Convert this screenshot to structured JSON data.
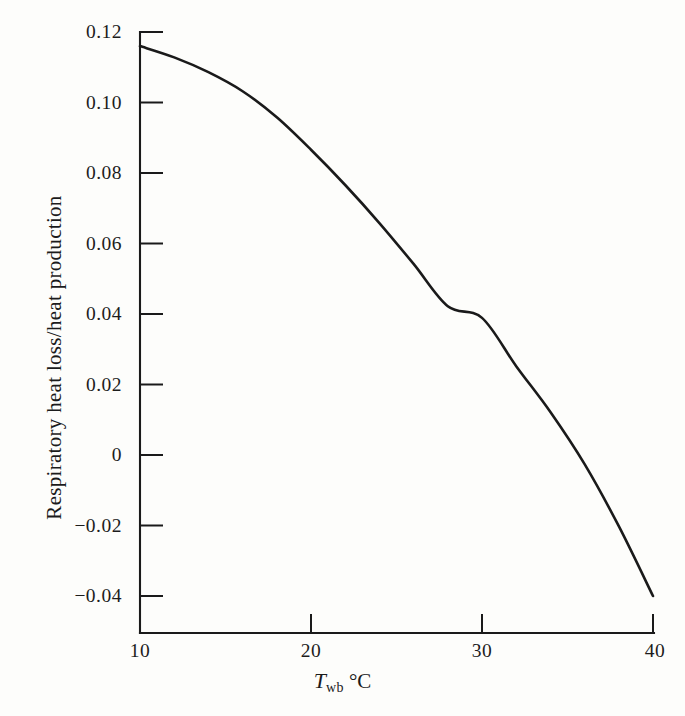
{
  "chart_data": {
    "type": "line",
    "title": "",
    "subtitle": "",
    "xlabel_symbol": "T",
    "xlabel_subscript": "wb",
    "xlabel_unit": "°C",
    "xlabel": "T_wb °C",
    "ylabel": "Respiratory heat loss/heat production",
    "xlim": [
      10,
      40
    ],
    "ylim": [
      -0.04,
      0.12
    ],
    "xticks": [
      10,
      20,
      30,
      40
    ],
    "yticks": [
      0.12,
      0.1,
      0.08,
      0.06,
      0.04,
      0.02,
      0,
      -0.02,
      -0.04
    ],
    "xtick_labels": [
      "10",
      "20",
      "30",
      "40"
    ],
    "ytick_labels": [
      "0.12",
      "0.10",
      "0.08",
      "0.06",
      "0.04",
      "0.02",
      "0",
      "−0.02",
      "−0.04"
    ],
    "grid": false,
    "legend": null,
    "legend_position": "none",
    "line_color": "#1a1a1a",
    "line_width": 2.6,
    "background_color": "#fdfdfb",
    "axis_color": "#1a1a1a",
    "series": [
      {
        "name": "Respiratory heat loss/heat production",
        "x": [
          10,
          12,
          14,
          16,
          18,
          20,
          22,
          24,
          26,
          28,
          30,
          32,
          34,
          36,
          38,
          40
        ],
        "values": [
          0.116,
          0.1128,
          0.1086,
          0.1032,
          0.0958,
          0.0866,
          0.0766,
          0.0658,
          0.0542,
          0.0422,
          0.0389,
          0.0252,
          0.0122,
          -0.0026,
          -0.0202,
          -0.04
        ]
      }
    ],
    "annotations": []
  },
  "axis_geometry": {
    "x_pixels": {
      "10": 140,
      "20": 311,
      "30": 482,
      "40": 653
    },
    "y_pixels": {
      "0.12": 32,
      "0.10": 102.5,
      "0.08": 173,
      "0.06": 243.5,
      "0.04": 314,
      "0.02": 384.5,
      "0": 455,
      "-0.02": 525.5,
      "-0.04": 596
    }
  }
}
